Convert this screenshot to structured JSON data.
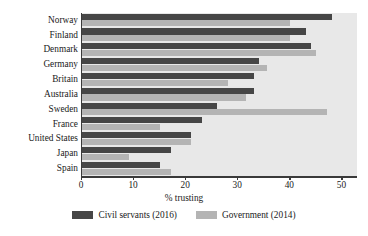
{
  "chart_data": {
    "type": "bar",
    "orientation": "horizontal",
    "title": "",
    "xlabel": "% trusting",
    "ylabel": "",
    "xlim": [
      0,
      52.8
    ],
    "xticks": [
      0,
      10,
      20,
      30,
      40,
      50
    ],
    "xtick_labels": [
      "0",
      "10",
      "20",
      "30",
      "40",
      "50"
    ],
    "grid": false,
    "legend_position": "bottom",
    "categories": [
      "Norway",
      "Finland",
      "Denmark",
      "Germany",
      "Britain",
      "Australia",
      "Sweden",
      "France",
      "United States",
      "Japan",
      "Spain"
    ],
    "series": [
      {
        "name": "Civil servants (2016)",
        "color": "#464646",
        "values": [
          48,
          43,
          44,
          34,
          33,
          33,
          26,
          23,
          21,
          17,
          15
        ]
      },
      {
        "name": "Government (2014)",
        "color": "#b4b4b4",
        "values": [
          40,
          40,
          45,
          35.5,
          28,
          31.5,
          47,
          15,
          21,
          9,
          17
        ]
      }
    ]
  },
  "legend": {
    "items": [
      {
        "label": "Civil servants (2016)",
        "color": "#464646"
      },
      {
        "label": "Government (2014)",
        "color": "#b4b4b4"
      }
    ]
  },
  "colors": {
    "plot_background": "#e8e8e8",
    "page_background": "#ffffff",
    "axis": "#3a3a3a",
    "text": "#1a1a1a"
  }
}
